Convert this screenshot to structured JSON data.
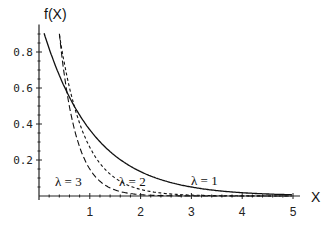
{
  "chart_data": {
    "type": "line",
    "title": "",
    "xlabel": "X",
    "ylabel": "f(X)",
    "xlim": [
      0,
      5
    ],
    "ylim": [
      0,
      0.92
    ],
    "x_ticks": [
      "1",
      "2",
      "3",
      "4",
      "5"
    ],
    "y_ticks": [
      "0.2",
      "0.4",
      "0.6",
      "0.8"
    ],
    "grid": false,
    "legend": "none (inline annotations)",
    "function": "f(x) = λ·e^(−λx)",
    "series": [
      {
        "name": "λ = 1",
        "style": "solid",
        "lambda": 1,
        "x": [
          0.1,
          0.5,
          1,
          1.5,
          2,
          3,
          4,
          5
        ],
        "values": [
          0.9,
          0.61,
          0.37,
          0.22,
          0.14,
          0.05,
          0.02,
          0.01
        ]
      },
      {
        "name": "λ = 2",
        "style": "dotted",
        "lambda": 2,
        "x": [
          0.3,
          0.5,
          1,
          1.5,
          2,
          3,
          4,
          5
        ],
        "values": [
          1.1,
          0.74,
          0.27,
          0.1,
          0.04,
          0.005,
          0.001,
          0.0
        ]
      },
      {
        "name": "λ = 3",
        "style": "dashed",
        "lambda": 3,
        "x": [
          0.4,
          0.5,
          1,
          1.5,
          2,
          3,
          4,
          5
        ],
        "values": [
          0.9,
          0.67,
          0.15,
          0.03,
          0.007,
          0.0,
          0.0,
          0.0
        ]
      }
    ],
    "annotations": [
      {
        "text": "λ = 3",
        "x": 0.45,
        "y": 0.05
      },
      {
        "text": "λ = 2",
        "x": 1.55,
        "y": 0.05
      },
      {
        "text": "λ = 1",
        "x": 2.9,
        "y": 0.05
      }
    ]
  },
  "labels": {
    "ylabel": "f(X)",
    "xlabel": "X",
    "lam3": "λ = 3",
    "lam2": "λ = 2",
    "lam1": "λ = 1"
  }
}
